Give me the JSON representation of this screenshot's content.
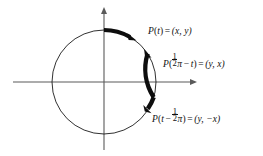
{
  "figure": {
    "background_color": "#ffffff",
    "ink_color": "#111111",
    "axis_color": "#555555",
    "width": 263,
    "height": 156
  },
  "axes": {
    "x_axis": {
      "name": "x-axis",
      "y": 82,
      "x_start": 13,
      "x_end": 197,
      "arrow": "right"
    },
    "y_axis": {
      "name": "y-axis",
      "x": 104,
      "y_start": 150,
      "y_end": 8,
      "arrow": "up"
    }
  },
  "circle": {
    "center_x": 104,
    "center_y": 82,
    "radius": 52,
    "stroke_width": 0.9
  },
  "arcs": [
    {
      "id": "arc-pt",
      "start_deg": 90,
      "end_deg": 60,
      "arrow_at_deg": 60,
      "label_ref": "labels.0"
    },
    {
      "id": "arc-phalf",
      "start_deg": 33,
      "end_deg": -17,
      "arrow_at_deg": 33,
      "label_ref": "labels.1"
    },
    {
      "id": "arc-pminus",
      "start_deg": -17,
      "end_deg": -30,
      "arrow_at_deg": -30,
      "label_ref": "labels.2"
    }
  ],
  "labels": [
    {
      "id": "lbl-pt",
      "text": "P(t) = (x, y)",
      "parts": {
        "fn": "P",
        "open": "(",
        "arg": "t",
        "close": ")",
        "eq": "=",
        "point": "(x, y)"
      },
      "x": 148,
      "y": 27
    },
    {
      "id": "lbl-phalf",
      "text": "P(½π − t) = (y, x)",
      "parts": {
        "fn": "P",
        "open": "(",
        "num": "1",
        "den": "2",
        "pi": "π",
        "minus": "−",
        "arg": "t",
        "close": ")",
        "eq": "=",
        "point": "(y, x)"
      },
      "x": 163,
      "y": 53
    },
    {
      "id": "lbl-pminus",
      "text": "P(t − ½π) = (y, −x)",
      "parts": {
        "fn": "P",
        "open": "(",
        "arg": "t",
        "minus": "−",
        "num": "1",
        "den": "2",
        "pi": "π",
        "close": ")",
        "eq": "=",
        "point": "(y, −x)"
      },
      "x": 152,
      "y": 108
    }
  ],
  "glyphs": {
    "minus": "−",
    "equals": "=",
    "comma": ",",
    "lparen": "(",
    "rparen": ")",
    "pi": "π"
  }
}
